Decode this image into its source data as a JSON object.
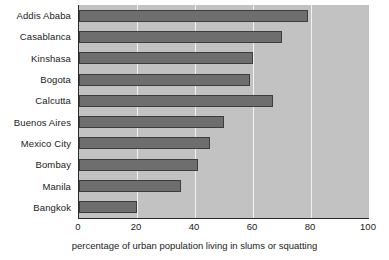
{
  "chart_data": {
    "type": "bar",
    "orientation": "horizontal",
    "title": "",
    "subtitle": "",
    "xlabel": "percentage of urban population living in slums or squatting",
    "ylabel": "",
    "categories": [
      "Addis Ababa",
      "Casablanca",
      "Kinshasa",
      "Bogota",
      "Calcutta",
      "Buenos Aires",
      "Mexico City",
      "Bombay",
      "Manila",
      "Bangkok"
    ],
    "values": [
      79,
      70,
      60,
      59,
      67,
      50,
      45,
      41,
      35,
      20
    ],
    "xlim": [
      0,
      100
    ],
    "xticks": [
      0,
      20,
      40,
      60,
      80,
      100
    ],
    "xtick_labels": [
      "0",
      "20",
      "40",
      "60",
      "80",
      "100"
    ],
    "grid": true,
    "grid_axis": "x",
    "legend": false,
    "legend_position": "none",
    "colors": {
      "bar_fill": "#6e6e6e",
      "bar_edge": "#3d3d3d",
      "plot_background": "#c2c2c2",
      "gridline": "#f2f2f2",
      "axis_line": "#2b2b2b",
      "figure_background": "#ffffff",
      "text": "#1a1a1a"
    }
  }
}
